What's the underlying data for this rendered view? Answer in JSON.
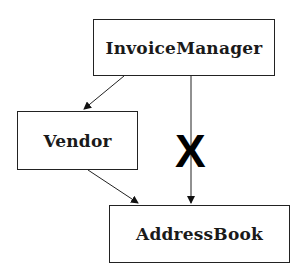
{
  "diagram": {
    "nodes": [
      {
        "id": "invoice-manager",
        "label": "InvoiceManager"
      },
      {
        "id": "vendor",
        "label": "Vendor"
      },
      {
        "id": "address-book",
        "label": "AddressBook"
      }
    ],
    "edges": [
      {
        "from": "InvoiceManager",
        "to": "Vendor",
        "allowed": true
      },
      {
        "from": "Vendor",
        "to": "AddressBook",
        "allowed": true
      },
      {
        "from": "InvoiceManager",
        "to": "AddressBook",
        "allowed": false
      }
    ],
    "forbidden_mark": "X"
  }
}
